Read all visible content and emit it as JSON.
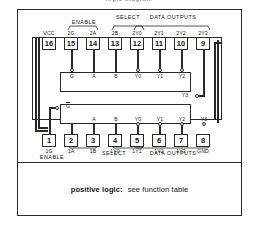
{
  "title_partial": "logic diagram",
  "frame": {
    "caption_bold": "positive logic:",
    "caption_rest": "see function table"
  },
  "diagram": {
    "package_type": "16-pin DIP logic diagram",
    "top_group_labels": [
      {
        "text": "ENABLE",
        "spans": "2G"
      },
      {
        "text": "SELECT",
        "spans": "2A-2B"
      },
      {
        "text": "DATA OUTPUTS",
        "spans": "2Y0-2Y3"
      }
    ],
    "bottom_group_labels": [
      {
        "text": "ENABLE",
        "spans": "1G"
      },
      {
        "text": "SELECT",
        "spans": "1A-1B"
      },
      {
        "text": "DATA OUTPUTS",
        "spans": "1Y0-1Y3"
      }
    ],
    "top_pins": [
      {
        "num": "16",
        "name": "VCC"
      },
      {
        "num": "15",
        "name": "2G"
      },
      {
        "num": "14",
        "name": "2A"
      },
      {
        "num": "13",
        "name": "2B"
      },
      {
        "num": "12",
        "name": "2Y0"
      },
      {
        "num": "11",
        "name": "2Y1"
      },
      {
        "num": "10",
        "name": "2Y2"
      },
      {
        "num": "9",
        "name": "2Y3"
      }
    ],
    "bottom_pins": [
      {
        "num": "1",
        "name": "1G"
      },
      {
        "num": "2",
        "name": "1A"
      },
      {
        "num": "3",
        "name": "1B"
      },
      {
        "num": "4",
        "name": "1Y0"
      },
      {
        "num": "5",
        "name": "1Y1"
      },
      {
        "num": "6",
        "name": "1Y2"
      },
      {
        "num": "7",
        "name": "1Y3"
      },
      {
        "num": "8",
        "name": "GND"
      }
    ],
    "top_block_ports": {
      "inputs": [
        "G",
        "A",
        "B"
      ],
      "outputs": [
        "Y0",
        "Y1",
        "Y2",
        "Y3"
      ]
    },
    "bottom_block_ports": {
      "inputs": [
        "G",
        "A",
        "B"
      ],
      "outputs": [
        "Y0",
        "Y1",
        "Y2",
        "Y3"
      ]
    }
  },
  "colors": {
    "ink": "#2a2a24",
    "paper": "#ffffff",
    "faint": "#9a9a93"
  }
}
